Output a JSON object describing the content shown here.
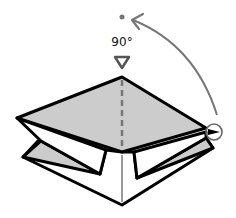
{
  "diagram": {
    "type": "origami-step",
    "annotation": {
      "angle_label": "90°"
    },
    "colors": {
      "paper_shaded": "#cccccc",
      "paper_white": "#ffffff",
      "outline": "#000000",
      "guide": "#777777"
    },
    "symbols": [
      "valley-fold-dashed-line",
      "push-here-triangle",
      "rotate-arrow",
      "target-dot",
      "circled-point-marker"
    ]
  }
}
